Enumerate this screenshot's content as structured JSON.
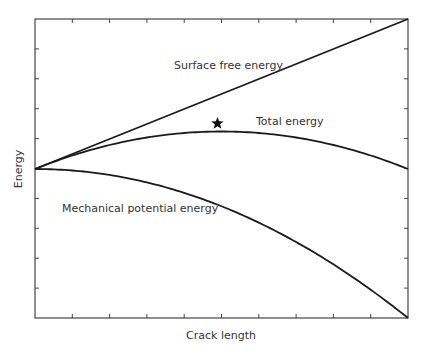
{
  "chart_data": {
    "type": "line",
    "title": "",
    "xlabel": "Crack length",
    "ylabel": "Energy",
    "grid": false,
    "legend": "none (inline curve labels)",
    "x_ticks": 10,
    "y_ticks": 10,
    "xlim": [
      0,
      1
    ],
    "ylim": [
      -1,
      1
    ],
    "series": [
      {
        "name": "Surface free energy",
        "shape": "linear increasing",
        "x": [
          0,
          0.25,
          0.5,
          0.75,
          1.0
        ],
        "values": [
          0,
          0.25,
          0.5,
          0.75,
          1.0
        ]
      },
      {
        "name": "Total energy",
        "shape": "concave, maximum marked with star",
        "x": [
          0,
          0.25,
          0.5,
          0.75,
          1.0
        ],
        "values": [
          0,
          0.19,
          0.25,
          0.19,
          0.0
        ]
      },
      {
        "name": "Mechanical potential energy",
        "shape": "quadratic decreasing",
        "x": [
          0,
          0.25,
          0.5,
          0.75,
          1.0
        ],
        "values": [
          0,
          -0.06,
          -0.25,
          -0.56,
          -1.0
        ]
      }
    ],
    "annotations": [
      {
        "type": "star-marker",
        "label": "maximum of total energy",
        "x": 0.5,
        "y": 0.25
      }
    ]
  },
  "labels": {
    "surface": "Surface free energy",
    "total": "Total  energy",
    "mechanical": "Mechanical potential energy",
    "xaxis": "Crack length",
    "yaxis": "Energy"
  },
  "colors": {
    "line": "#1a1a1a",
    "frame": "#444444",
    "text": "#333333"
  }
}
